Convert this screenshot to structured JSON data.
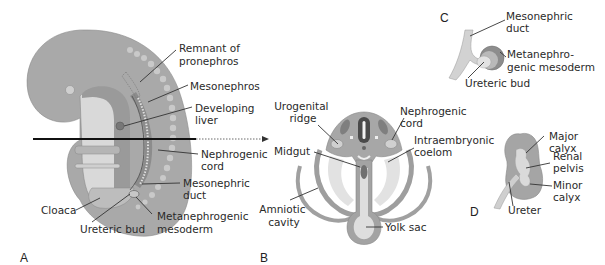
{
  "panels": {
    "A": {
      "letter": "A",
      "labels": {
        "remnant_of_pronephros": [
          "Remnant of",
          "pronephros"
        ],
        "mesonephros": [
          "Mesonephros"
        ],
        "developing_liver": [
          "Developing",
          "liver"
        ],
        "nephrogenic_cord": [
          "Nephrogenic",
          "cord"
        ],
        "mesonephric_duct": [
          "Mesonephric",
          "duct"
        ],
        "metanephrogenic_mesoderm": [
          "Metanephrogenic",
          "mesoderm"
        ],
        "cloaca": [
          "Cloaca"
        ],
        "ureteric_bud": [
          "Ureteric bud"
        ]
      }
    },
    "B": {
      "letter": "B",
      "labels": {
        "urogenital_ridge": [
          "Urogenital",
          "ridge"
        ],
        "nephrogenic_cord": [
          "Nephrogenic",
          "cord"
        ],
        "midgut": [
          "Midgut"
        ],
        "intraembryonic_coelom": [
          "Intraembryonic",
          "coelom"
        ],
        "amniotic_cavity": [
          "Amniotic",
          "cavity"
        ],
        "yolk_sac": [
          "Yolk sac"
        ]
      }
    },
    "C": {
      "letter": "C",
      "labels": {
        "mesonephric_duct": [
          "Mesonephric",
          "duct"
        ],
        "metanephrogenic_mesoderm": [
          "Metanephro-",
          "genic mesoderm"
        ],
        "ureteric_bud": [
          "Ureteric bud"
        ]
      }
    },
    "D": {
      "letter": "D",
      "labels": {
        "major_calyx": [
          "Major",
          "calyx"
        ],
        "renal_pelvis": [
          "Renal",
          "pelvis"
        ],
        "minor_calyx": [
          "Minor",
          "calyx"
        ],
        "ureter": [
          "Ureter"
        ]
      }
    }
  },
  "colors": {
    "body": "#a9a9a9",
    "body_dark": "#8e8e8e",
    "light": "#d6d6d6",
    "pale": "#e6e6e6",
    "dark": "#5c5c5c",
    "line": "#333333"
  }
}
